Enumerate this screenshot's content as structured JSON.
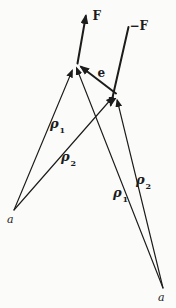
{
  "diagram": {
    "labels": {
      "force": "F",
      "force_neg": "−F",
      "unit_vector": "e",
      "rho": "ρ",
      "sub_1": "1",
      "sub_2": "2",
      "origin_left": "a",
      "origin_right": "a"
    },
    "colors": {
      "ink": "#1c1c1c",
      "bg": "#fbfbf9"
    }
  }
}
